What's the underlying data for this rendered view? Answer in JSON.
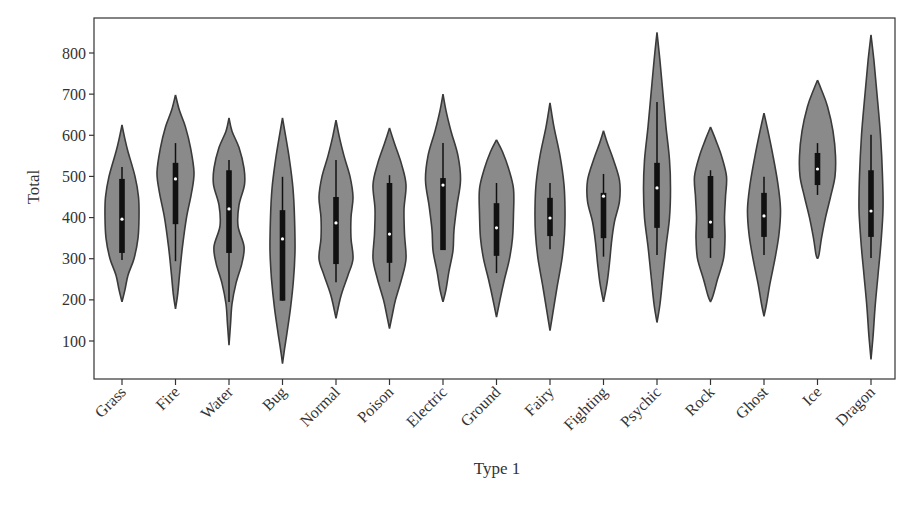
{
  "chart_data": {
    "type": "violin",
    "title": "",
    "xlabel": "Type 1",
    "ylabel": "Total",
    "ylim": [
      5,
      870
    ],
    "yticks": [
      100,
      200,
      300,
      400,
      500,
      600,
      700,
      800
    ],
    "grid": false,
    "legend": null,
    "categories": [
      "Grass",
      "Fire",
      "Water",
      "Bug",
      "Normal",
      "Poison",
      "Electric",
      "Ground",
      "Fairy",
      "Fighting",
      "Psychic",
      "Rock",
      "Ghost",
      "Ice",
      "Dragon"
    ],
    "series": [
      {
        "name": "Grass",
        "min": 195,
        "max": 625,
        "whisker_low": 297,
        "q1": 314,
        "median": 396,
        "q3": 494,
        "whisker_high": 523,
        "profile": [
          [
            625,
            0
          ],
          [
            590,
            3
          ],
          [
            560,
            6
          ],
          [
            500,
            13
          ],
          [
            450,
            16.5
          ],
          [
            400,
            17
          ],
          [
            350,
            16
          ],
          [
            300,
            12
          ],
          [
            260,
            6
          ],
          [
            225,
            3
          ],
          [
            195,
            0
          ]
        ]
      },
      {
        "name": "Fire",
        "min": 178,
        "max": 698,
        "whisker_low": 294,
        "q1": 384,
        "median": 494,
        "q3": 533,
        "whisker_high": 581,
        "profile": [
          [
            698,
            0
          ],
          [
            660,
            4
          ],
          [
            620,
            10
          ],
          [
            570,
            15
          ],
          [
            510,
            18.5
          ],
          [
            460,
            16
          ],
          [
            400,
            11
          ],
          [
            330,
            7
          ],
          [
            260,
            4
          ],
          [
            210,
            2
          ],
          [
            178,
            0
          ]
        ]
      },
      {
        "name": "Water",
        "min": 90,
        "max": 642,
        "whisker_low": 195,
        "q1": 314,
        "median": 421,
        "q3": 515,
        "whisker_high": 540,
        "profile": [
          [
            642,
            0
          ],
          [
            610,
            3
          ],
          [
            570,
            10
          ],
          [
            520,
            15
          ],
          [
            480,
            15.5
          ],
          [
            430,
            10
          ],
          [
            380,
            9
          ],
          [
            330,
            15
          ],
          [
            290,
            13
          ],
          [
            240,
            7
          ],
          [
            190,
            3
          ],
          [
            140,
            1.5
          ],
          [
            90,
            0
          ]
        ]
      },
      {
        "name": "Bug",
        "min": 45,
        "max": 642,
        "whisker_low": 198,
        "q1": 198,
        "median": 348,
        "q3": 418,
        "whisker_high": 499,
        "profile": [
          [
            642,
            0
          ],
          [
            600,
            3
          ],
          [
            540,
            7
          ],
          [
            470,
            10.5
          ],
          [
            400,
            12
          ],
          [
            320,
            12.5
          ],
          [
            250,
            11
          ],
          [
            180,
            8
          ],
          [
            120,
            4.5
          ],
          [
            80,
            2
          ],
          [
            45,
            0
          ]
        ]
      },
      {
        "name": "Normal",
        "min": 155,
        "max": 637,
        "whisker_low": 243,
        "q1": 287,
        "median": 387,
        "q3": 450,
        "whisker_high": 540,
        "profile": [
          [
            637,
            0
          ],
          [
            600,
            3
          ],
          [
            550,
            8
          ],
          [
            500,
            14
          ],
          [
            450,
            17
          ],
          [
            400,
            15
          ],
          [
            350,
            15
          ],
          [
            300,
            17
          ],
          [
            260,
            12
          ],
          [
            210,
            5
          ],
          [
            155,
            0
          ]
        ]
      },
      {
        "name": "Poison",
        "min": 130,
        "max": 618,
        "whisker_low": 244,
        "q1": 290,
        "median": 360,
        "q3": 484,
        "whisker_high": 503,
        "profile": [
          [
            618,
            0
          ],
          [
            580,
            5
          ],
          [
            530,
            12
          ],
          [
            480,
            16.5
          ],
          [
            420,
            14.5
          ],
          [
            360,
            15
          ],
          [
            300,
            16.5
          ],
          [
            250,
            12
          ],
          [
            200,
            6
          ],
          [
            160,
            2.5
          ],
          [
            130,
            0
          ]
        ]
      },
      {
        "name": "Electric",
        "min": 195,
        "max": 700,
        "whisker_low": 321,
        "q1": 321,
        "median": 479,
        "q3": 496,
        "whisker_high": 581,
        "profile": [
          [
            700,
            0
          ],
          [
            660,
            3
          ],
          [
            610,
            8
          ],
          [
            550,
            15
          ],
          [
            490,
            17.5
          ],
          [
            430,
            14
          ],
          [
            370,
            11
          ],
          [
            320,
            10
          ],
          [
            270,
            6
          ],
          [
            225,
            3
          ],
          [
            195,
            0
          ]
        ]
      },
      {
        "name": "Ground",
        "min": 158,
        "max": 589,
        "whisker_low": 265,
        "q1": 307,
        "median": 375,
        "q3": 435,
        "whisker_high": 484,
        "profile": [
          [
            589,
            0
          ],
          [
            560,
            6
          ],
          [
            520,
            12
          ],
          [
            470,
            17
          ],
          [
            410,
            17
          ],
          [
            350,
            16
          ],
          [
            300,
            13
          ],
          [
            250,
            8
          ],
          [
            200,
            3.5
          ],
          [
            158,
            0
          ]
        ]
      },
      {
        "name": "Fairy",
        "min": 125,
        "max": 679,
        "whisker_low": 323,
        "q1": 355,
        "median": 399,
        "q3": 448,
        "whisker_high": 484,
        "profile": [
          [
            679,
            0
          ],
          [
            620,
            4
          ],
          [
            550,
            10
          ],
          [
            480,
            14
          ],
          [
            420,
            15
          ],
          [
            360,
            14.5
          ],
          [
            300,
            12
          ],
          [
            230,
            7
          ],
          [
            170,
            3
          ],
          [
            125,
            0
          ]
        ]
      },
      {
        "name": "Fighting",
        "min": 195,
        "max": 611,
        "whisker_low": 305,
        "q1": 350,
        "median": 452,
        "q3": 460,
        "whisker_high": 506,
        "profile": [
          [
            611,
            0
          ],
          [
            580,
            4
          ],
          [
            540,
            10
          ],
          [
            490,
            16
          ],
          [
            440,
            16
          ],
          [
            390,
            11
          ],
          [
            340,
            8
          ],
          [
            290,
            6
          ],
          [
            240,
            3.5
          ],
          [
            195,
            0
          ]
        ]
      },
      {
        "name": "Psychic",
        "min": 145,
        "max": 850,
        "whisker_low": 309,
        "q1": 375,
        "median": 472,
        "q3": 533,
        "whisker_high": 681,
        "profile": [
          [
            850,
            0
          ],
          [
            780,
            3
          ],
          [
            700,
            6
          ],
          [
            620,
            9
          ],
          [
            540,
            12.5
          ],
          [
            470,
            13.5
          ],
          [
            400,
            12.5
          ],
          [
            330,
            9
          ],
          [
            260,
            6
          ],
          [
            190,
            3
          ],
          [
            145,
            0
          ]
        ]
      },
      {
        "name": "Rock",
        "min": 195,
        "max": 620,
        "whisker_low": 302,
        "q1": 350,
        "median": 389,
        "q3": 501,
        "whisker_high": 515,
        "profile": [
          [
            620,
            0
          ],
          [
            590,
            5
          ],
          [
            550,
            11
          ],
          [
            500,
            16
          ],
          [
            450,
            15
          ],
          [
            400,
            14
          ],
          [
            350,
            14.5
          ],
          [
            300,
            13
          ],
          [
            250,
            7
          ],
          [
            210,
            2.5
          ],
          [
            195,
            0
          ]
        ]
      },
      {
        "name": "Ghost",
        "min": 160,
        "max": 654,
        "whisker_low": 309,
        "q1": 353,
        "median": 404,
        "q3": 460,
        "whisker_high": 499,
        "profile": [
          [
            654,
            0
          ],
          [
            610,
            4
          ],
          [
            550,
            9
          ],
          [
            480,
            14
          ],
          [
            420,
            16.5
          ],
          [
            360,
            15
          ],
          [
            300,
            11
          ],
          [
            240,
            6
          ],
          [
            190,
            2.5
          ],
          [
            160,
            0
          ]
        ]
      },
      {
        "name": "Ice",
        "min": 300,
        "max": 734,
        "whisker_low": 455,
        "q1": 479,
        "median": 518,
        "q3": 557,
        "whisker_high": 581,
        "profile": [
          [
            734,
            0
          ],
          [
            710,
            4
          ],
          [
            670,
            10
          ],
          [
            610,
            15.5
          ],
          [
            550,
            18
          ],
          [
            500,
            17.5
          ],
          [
            450,
            13
          ],
          [
            400,
            8
          ],
          [
            350,
            4
          ],
          [
            310,
            1.5
          ],
          [
            300,
            0
          ]
        ]
      },
      {
        "name": "Dragon",
        "min": 55,
        "max": 844,
        "whisker_low": 302,
        "q1": 353,
        "median": 416,
        "q3": 515,
        "whisker_high": 601,
        "profile": [
          [
            844,
            0
          ],
          [
            780,
            3
          ],
          [
            700,
            6
          ],
          [
            600,
            9.5
          ],
          [
            500,
            11.5
          ],
          [
            420,
            12
          ],
          [
            340,
            10
          ],
          [
            260,
            7
          ],
          [
            180,
            4
          ],
          [
            110,
            2
          ],
          [
            55,
            0
          ]
        ]
      }
    ]
  },
  "axes": {
    "x_label": "Type 1",
    "y_label": "Total"
  }
}
